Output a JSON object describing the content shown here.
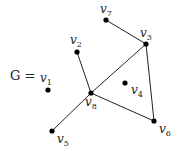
{
  "diagram": {
    "title": "G =",
    "type": "undirected-graph",
    "nodes": [
      {
        "id": "v1",
        "base": "v",
        "sub": "1",
        "x": 48,
        "y": 90,
        "lx": 40,
        "ly": 82
      },
      {
        "id": "v2",
        "base": "v",
        "sub": "2",
        "x": 77,
        "y": 52,
        "lx": 70,
        "ly": 44
      },
      {
        "id": "v3",
        "base": "v",
        "sub": "3",
        "x": 146,
        "y": 44,
        "lx": 140,
        "ly": 37
      },
      {
        "id": "v4",
        "base": "v",
        "sub": "4",
        "x": 125,
        "y": 83,
        "lx": 131,
        "ly": 94
      },
      {
        "id": "v5",
        "base": "v",
        "sub": "5",
        "x": 52,
        "y": 131,
        "lx": 57,
        "ly": 143
      },
      {
        "id": "v6",
        "base": "v",
        "sub": "6",
        "x": 154,
        "y": 121,
        "lx": 159,
        "ly": 133
      },
      {
        "id": "v7",
        "base": "v",
        "sub": "7",
        "x": 106,
        "y": 20,
        "lx": 100,
        "ly": 13
      },
      {
        "id": "v8",
        "base": "v",
        "sub": "8",
        "x": 91,
        "y": 93,
        "lx": 85,
        "ly": 106
      }
    ],
    "edges": [
      [
        "v7",
        "v3"
      ],
      [
        "v3",
        "v8"
      ],
      [
        "v3",
        "v6"
      ],
      [
        "v2",
        "v8"
      ],
      [
        "v8",
        "v6"
      ],
      [
        "v8",
        "v5"
      ]
    ],
    "colors": {
      "node": "#000000",
      "edge": "#222222",
      "text": "#222222"
    }
  }
}
